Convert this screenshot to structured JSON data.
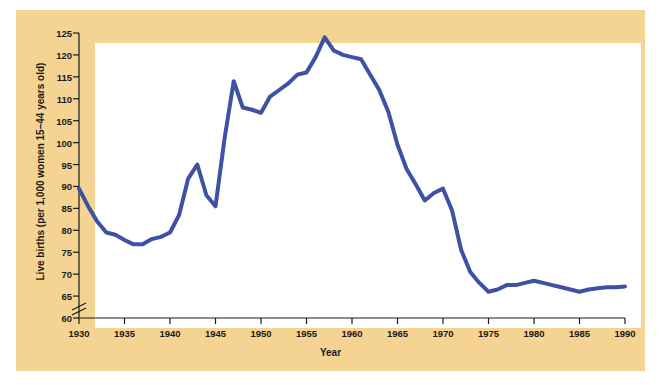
{
  "figure": {
    "panel_background": "#f5d393",
    "plot_background": "#ffffff",
    "page_background": "#ffffff"
  },
  "chart_data": {
    "type": "line",
    "title": "",
    "xlabel": "Year",
    "ylabel": "Live births (per 1,000 women 15–44 years old)",
    "xlim": [
      1930,
      1990
    ],
    "ylim": [
      60,
      125
    ],
    "grid": false,
    "legend": null,
    "axis_break": {
      "axis": "y",
      "below": 60,
      "symbol": "double-slash"
    },
    "line_color": "#3f51a5",
    "line_width": 4,
    "xticks": [
      1930,
      1935,
      1940,
      1945,
      1950,
      1955,
      1960,
      1965,
      1970,
      1975,
      1980,
      1985,
      1990
    ],
    "xtick_labels": [
      "1930",
      "1935",
      "1940",
      "1945",
      "1950",
      "1955",
      "1960",
      "1965",
      "1970",
      "1975",
      "1980",
      "1985",
      "1990"
    ],
    "yticks": [
      60,
      65,
      70,
      75,
      80,
      85,
      90,
      95,
      100,
      105,
      110,
      115,
      120,
      125
    ],
    "ytick_labels": [
      "60",
      "65",
      "70",
      "75",
      "80",
      "85",
      "90",
      "95",
      "100",
      "105",
      "110",
      "115",
      "120",
      "125"
    ],
    "series": [
      {
        "name": "Live births per 1,000 women 15-44 years old",
        "x": [
          1930,
          1931,
          1932,
          1933,
          1934,
          1935,
          1936,
          1937,
          1938,
          1939,
          1940,
          1941,
          1942,
          1943,
          1944,
          1945,
          1946,
          1947,
          1948,
          1949,
          1950,
          1951,
          1952,
          1953,
          1954,
          1955,
          1956,
          1957,
          1958,
          1959,
          1960,
          1961,
          1962,
          1963,
          1964,
          1965,
          1966,
          1967,
          1968,
          1969,
          1970,
          1971,
          1972,
          1973,
          1974,
          1975,
          1976,
          1977,
          1978,
          1979,
          1980,
          1981,
          1982,
          1983,
          1984,
          1985,
          1986,
          1987,
          1988,
          1989,
          1990
        ],
        "y": [
          89.5,
          85.5,
          82.0,
          79.5,
          79.0,
          77.8,
          76.8,
          76.8,
          78.0,
          78.5,
          79.5,
          83.5,
          91.8,
          95.0,
          88.0,
          85.5,
          101.0,
          114.0,
          108.0,
          107.5,
          106.8,
          110.5,
          112.0,
          113.5,
          115.5,
          116.0,
          119.5,
          124.0,
          121.0,
          120.0,
          119.5,
          119.0,
          115.5,
          112.0,
          107.0,
          99.5,
          94.0,
          90.5,
          86.8,
          88.5,
          89.5,
          84.5,
          75.5,
          70.5,
          68.0,
          66.0,
          66.5,
          67.5,
          67.5,
          68.0,
          68.5,
          68.0,
          67.5,
          67.0,
          66.5,
          66.0,
          66.5,
          66.8,
          67.0,
          67.0,
          67.2
        ]
      }
    ]
  }
}
